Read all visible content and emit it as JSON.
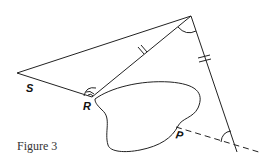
{
  "figure": {
    "caption": "Figure 3",
    "labels": {
      "S": "S",
      "R": "R",
      "P": "P"
    },
    "elements": [
      "line-S-to-apex",
      "line-apex-to-bottom-right",
      "dashed-line-P-extension",
      "irregular-region-blob",
      "angle-arc-apex",
      "angle-arc-bottom-right",
      "double-angle-arc-R",
      "equal-length-tick-upper",
      "equal-length-tick-right"
    ],
    "colors": {
      "stroke": "#222222",
      "background": "#ffffff"
    }
  }
}
